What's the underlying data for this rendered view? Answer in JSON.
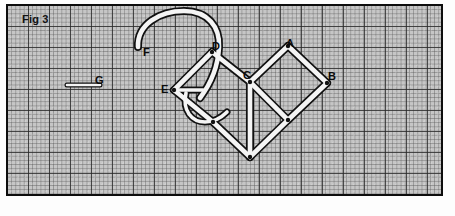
{
  "figure": {
    "caption": "Fig 3",
    "background": "#c6c6c6",
    "frame_color": "#0d0d0d",
    "stroke_color": "#111111",
    "fill_color": "#f4f4f4",
    "grid": {
      "minor_cell_px": 4.2,
      "major_cell_px": 21,
      "major_every": 5
    }
  },
  "vertex_labels": [
    {
      "id": "F",
      "text": "F",
      "x": 143,
      "y": 47
    },
    {
      "id": "D",
      "text": "D",
      "x": 212,
      "y": 41
    },
    {
      "id": "A",
      "text": "A",
      "x": 286,
      "y": 38
    },
    {
      "id": "B",
      "text": "B",
      "x": 328,
      "y": 71
    },
    {
      "id": "C",
      "text": "C",
      "x": 243,
      "y": 70
    },
    {
      "id": "E",
      "text": "E",
      "x": 161,
      "y": 84
    },
    {
      "id": "G",
      "text": "G",
      "x": 95,
      "y": 75
    }
  ],
  "vertices": {
    "A": [
      288,
      46
    ],
    "B": [
      327,
      83
    ],
    "C": [
      250,
      82
    ],
    "D": [
      212,
      52
    ],
    "E": [
      174,
      90
    ],
    "right_bottom": [
      288,
      120
    ],
    "left_bottom": [
      250,
      157
    ],
    "F_tip": [
      138,
      46
    ]
  },
  "segments": [
    {
      "name": "A-B",
      "from": [
        288,
        46
      ],
      "to": [
        327,
        83
      ]
    },
    {
      "name": "A-C",
      "from": [
        288,
        46
      ],
      "to": [
        250,
        82
      ]
    },
    {
      "name": "B-RB",
      "from": [
        327,
        83
      ],
      "to": [
        288,
        120
      ]
    },
    {
      "name": "C-RB",
      "from": [
        250,
        82
      ],
      "to": [
        288,
        120
      ]
    },
    {
      "name": "D-C",
      "from": [
        212,
        52
      ],
      "to": [
        250,
        82
      ]
    },
    {
      "name": "D-E",
      "from": [
        212,
        52
      ],
      "to": [
        174,
        90
      ]
    },
    {
      "name": "E-LB-upper",
      "from": [
        174,
        90
      ],
      "to": [
        213,
        122
      ]
    },
    {
      "name": "LB-diag",
      "from": [
        213,
        122
      ],
      "to": [
        250,
        157
      ]
    },
    {
      "name": "C-LB",
      "from": [
        250,
        82
      ],
      "to": [
        250,
        157
      ]
    },
    {
      "name": "LB-RB",
      "from": [
        250,
        157
      ],
      "to": [
        288,
        120
      ]
    },
    {
      "name": "G-bar",
      "from": [
        67,
        85
      ],
      "to": [
        100,
        85
      ]
    },
    {
      "name": "E-bar",
      "from": [
        174,
        90
      ],
      "to": [
        203,
        90
      ]
    }
  ],
  "curves": [
    {
      "name": "hook-F",
      "description": "large hook arc from F up over and down past D"
    },
    {
      "name": "j-curl",
      "description": "small J shaped curl below E toward centre"
    }
  ]
}
